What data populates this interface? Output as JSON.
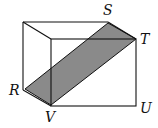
{
  "diagram": {
    "type": "rectangular prism with shaded cross-section",
    "labels": {
      "S": "S",
      "T": "T",
      "R": "R",
      "U": "U",
      "V": "V"
    },
    "colors": {
      "edge": "#111111",
      "shade": "#8a8a8a",
      "background": "#ffffff"
    }
  }
}
